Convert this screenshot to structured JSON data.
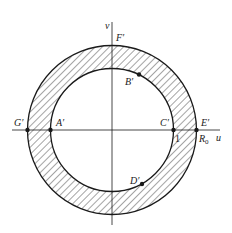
{
  "figure": {
    "type": "annulus-mapping-diagram",
    "colors": {
      "stroke": "#1a1a1a",
      "background": "#ffffff",
      "hatch": "#1a1a1a"
    },
    "axes": {
      "horizontal_label": "u",
      "vertical_label": "v"
    },
    "outer_circle": {
      "radius_label": "R",
      "radius_subscript": "0"
    },
    "inner_circle": {
      "radius_label": "1"
    },
    "points": [
      {
        "name": "A'",
        "location": "inner circle, negative u-axis"
      },
      {
        "name": "B'",
        "location": "inner circle, upper right"
      },
      {
        "name": "C'",
        "location": "inner circle, positive u-axis"
      },
      {
        "name": "D'",
        "location": "inner circle, lower right"
      },
      {
        "name": "E'",
        "location": "outer circle, positive u-axis"
      },
      {
        "name": "F'",
        "location": "outer circle, positive v-axis"
      },
      {
        "name": "G'",
        "location": "outer circle, negative u-axis"
      }
    ],
    "labels": {
      "A": "A′",
      "B": "B′",
      "C": "C′",
      "D": "D′",
      "E": "E′",
      "F": "F′",
      "G": "G′",
      "one": "1",
      "R": "R",
      "R_sub": "0",
      "u": "u",
      "v": "v"
    }
  }
}
